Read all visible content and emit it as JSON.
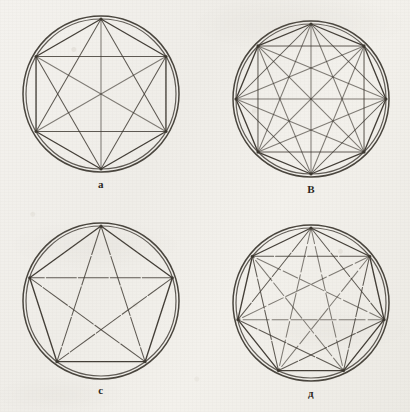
{
  "page": {
    "kind": "scanned-book-plate",
    "background_color": "#f1efea",
    "ink_color": "#3a352e",
    "width": 410,
    "height": 412
  },
  "figures": [
    {
      "id": "figure-a",
      "label": "a",
      "shape": "hexagon",
      "sides": 6,
      "vertices": 6,
      "chords": 15,
      "rings": 2,
      "center_x": 101,
      "center_y": 94,
      "radius_outer": 78,
      "radius_inner": 75,
      "rotation_deg": -90,
      "caption_y": 178
    },
    {
      "id": "figure-b",
      "label": "B",
      "shape": "octagon",
      "sides": 8,
      "vertices": 8,
      "chords": 28,
      "rings": 2,
      "center_x": 311,
      "center_y": 99,
      "radius_outer": 78,
      "radius_inner": 75,
      "rotation_deg": -90,
      "caption_y": 183
    },
    {
      "id": "figure-c",
      "label": "c",
      "shape": "pentagon",
      "sides": 5,
      "vertices": 5,
      "chords": 10,
      "rings": 2,
      "center_x": 101,
      "center_y": 301,
      "radius_outer": 78,
      "radius_inner": 75,
      "rotation_deg": -90,
      "caption_y": 384
    },
    {
      "id": "figure-d",
      "label": "д",
      "shape": "heptagon",
      "sides": 7,
      "vertices": 7,
      "chords": 21,
      "rings": 2,
      "center_x": 311,
      "center_y": 303,
      "radius_outer": 78,
      "radius_inner": 75,
      "rotation_deg": -90,
      "caption_y": 387
    }
  ]
}
